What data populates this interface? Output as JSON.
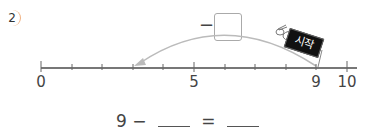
{
  "problem": {
    "number": "2",
    "minus_sign": "−",
    "start_sign": "시작",
    "equation": {
      "start": "9",
      "op": "−",
      "equals": "="
    }
  },
  "number_line": {
    "min": 0,
    "max": 10,
    "step": 1,
    "labels": [
      "0",
      "5",
      "9",
      "10"
    ],
    "jump_from": 9,
    "jump_to": 3,
    "colors": {
      "line": "#777777",
      "arrow": "#bbbbbb"
    }
  }
}
